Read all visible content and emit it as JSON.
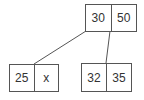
{
  "diagram": {
    "type": "b-tree",
    "root": {
      "keys": [
        "30",
        "50"
      ]
    },
    "children": [
      {
        "keys": [
          "25",
          "x"
        ]
      },
      {
        "keys": [
          "32",
          "35"
        ]
      }
    ],
    "colors": {
      "stroke": "#555555",
      "text": "#333333",
      "background": "#ffffff"
    }
  }
}
